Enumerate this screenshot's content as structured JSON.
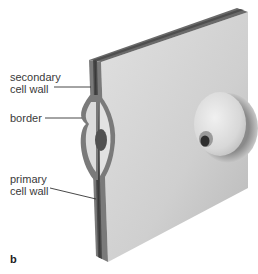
{
  "figure": {
    "panel_label": "b",
    "labels": {
      "secondary": "secondary\ncell wall",
      "border": "border",
      "primary": "primary\ncell wall"
    }
  },
  "colors": {
    "face": "#d6d6d6",
    "face_shadow": "#bdbdbd",
    "wall_dark": "#5a5a5a",
    "wall_mid": "#7c7c7c",
    "leader": "#333333"
  }
}
